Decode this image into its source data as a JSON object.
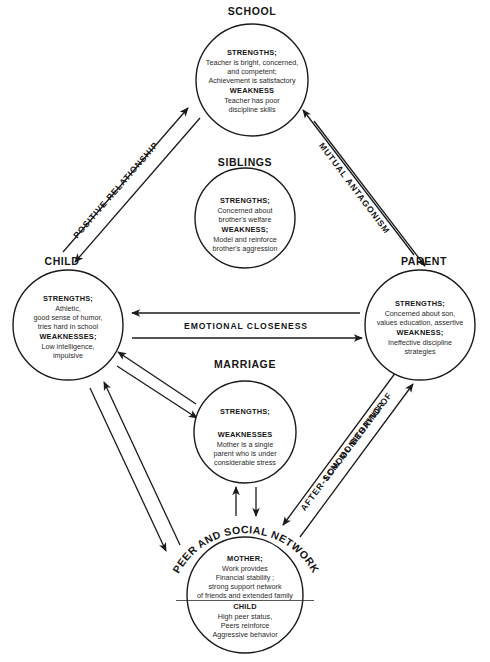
{
  "diagram": {
    "type": "ecomap",
    "nodes": [
      {
        "id": "school",
        "label": "SCHOOL",
        "cx": 252,
        "cy": 80,
        "r": 56,
        "sections": [
          {
            "heading": "STRENGTHS;",
            "lines": [
              "Teacher is bright, concerned,",
              "and competent;",
              "Achievement  is satisfactory"
            ]
          },
          {
            "heading": "WEAKNESS",
            "lines": [
              "Teacher has poor",
              "discipline skills"
            ]
          }
        ]
      },
      {
        "id": "siblings",
        "label": "SIBLINGS",
        "cx": 245,
        "cy": 218,
        "r": 50,
        "sections": [
          {
            "heading": "STRENGTHS;",
            "lines": [
              "Concerned about",
              "brother's welfare"
            ]
          },
          {
            "heading": "WEAKNESS;",
            "lines": [
              "Model and reinforce",
              "brother's aggression"
            ]
          }
        ]
      },
      {
        "id": "child",
        "label": "CHILD",
        "cx": 68,
        "cy": 325,
        "r": 55,
        "sections": [
          {
            "heading": "STRENGTHS;",
            "lines": [
              "Athletic,",
              "good sense of humor,",
              "tries hard in school"
            ]
          },
          {
            "heading": "WEAKNESSES;",
            "lines": [
              "Low intelligence,",
              "impulsive"
            ]
          }
        ]
      },
      {
        "id": "parent",
        "label": "PARENT",
        "cx": 420,
        "cy": 325,
        "r": 55,
        "sections": [
          {
            "heading": "STRENGTHS;",
            "lines": [
              "Concerned about son,",
              "values education, assertive"
            ]
          },
          {
            "heading": "WEAKNESS;",
            "lines": [
              "Ineffective discipline",
              "strategies"
            ]
          }
        ]
      },
      {
        "id": "marriage",
        "label": "MARRIAGE",
        "cx": 245,
        "cy": 432,
        "r": 51,
        "sections": [
          {
            "heading": "STRENGTHS;",
            "lines": []
          },
          {
            "heading": "WEAKNESSES",
            "lines": [
              "Mother is a single",
              "parent who is under",
              "considerable stress"
            ]
          }
        ]
      },
      {
        "id": "peer_social_network",
        "label": "PEER  AND  SOCIAL  NETWORK",
        "label_style": "arc",
        "cx": 245,
        "cy": 595,
        "r": 58,
        "sections": [
          {
            "heading": "MOTHER;",
            "lines": [
              "Work provides",
              "Financial stability ;",
              "strong support network",
              "of friends and extended family"
            ]
          },
          {
            "heading": "CHILD",
            "lines": [
              "High peer status,",
              "Peers reinforce",
              "Aggressive behavior"
            ]
          }
        ]
      }
    ],
    "edges": [
      {
        "id": "positive-relationship",
        "label": "POSITIVE RELATIONSHIP",
        "from": "school",
        "to": "child",
        "arrows": "both",
        "style": "double-line-diagonal"
      },
      {
        "id": "mutual-antagonism",
        "label": "MUTUAL ANTAGONISM",
        "from": "parent",
        "to": "school",
        "arrows": "both",
        "style": "double-line-diagonal"
      },
      {
        "id": "emotional-closeness",
        "label": "EMOTIONAL CLOSENESS",
        "from": "child",
        "to": "parent",
        "arrows": "both",
        "style": "double-line-horizontal"
      },
      {
        "id": "child-marriage",
        "label": "",
        "from": "child",
        "to": "marriage",
        "arrows": "both",
        "style": "double-line-diagonal"
      },
      {
        "id": "marriage-network",
        "label": "",
        "from": "marriage",
        "to": "peer_social_network",
        "arrows": "both",
        "style": "double-arrow-vertical"
      },
      {
        "id": "child-network",
        "label": "",
        "from": "child",
        "to": "peer_social_network",
        "arrows": "both",
        "style": "double-line-diagonal"
      },
      {
        "id": "low-monitoring",
        "label_line1": "LOW MONITORING OF",
        "label_line2": "AFTER-SCHOOL  BEHAVIOR",
        "from": "parent",
        "to": "peer_social_network",
        "arrows": "both",
        "style": "double-line-diagonal"
      }
    ],
    "colors": {
      "stroke": "#1a1a1a",
      "text": "#151515",
      "background": "#ffffff"
    }
  }
}
